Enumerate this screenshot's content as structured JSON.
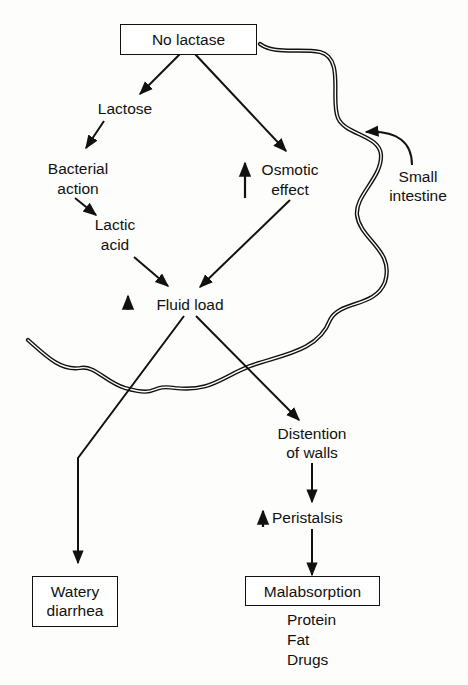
{
  "diagram": {
    "type": "flowchart",
    "topic": "Lactose intolerance pathophysiology",
    "nodes": {
      "no_lactase": "No lactase",
      "lactose": "Lactose",
      "bacterial_action_1": "Bacterial",
      "bacterial_action_2": "action",
      "lactic_acid_1": "Lactic",
      "lactic_acid_2": "acid",
      "osmotic_effect_1": "Osmotic",
      "osmotic_effect_2": "effect",
      "fluid_load": "Fluid load",
      "small_intestine_1": "Small",
      "small_intestine_2": "intestine",
      "distention_1": "Distention",
      "distention_2": "of walls",
      "peristalsis": "Peristalsis",
      "watery_diarrhea_1": "Watery",
      "watery_diarrhea_2": "diarrhea",
      "malabsorption": "Malabsorption",
      "malabsorbed": [
        "Protein",
        "Fat",
        "Drugs"
      ]
    },
    "increase_markers": [
      "Osmotic effect",
      "Fluid load",
      "Peristalsis"
    ],
    "edges": [
      [
        "No lactase",
        "Lactose"
      ],
      [
        "No lactase",
        "Osmotic effect"
      ],
      [
        "Lactose",
        "Bacterial action"
      ],
      [
        "Bacterial action",
        "Lactic acid"
      ],
      [
        "Lactic acid",
        "Fluid load"
      ],
      [
        "Osmotic effect",
        "Fluid load"
      ],
      [
        "Fluid load",
        "Watery diarrhea"
      ],
      [
        "Fluid load",
        "Distention of walls"
      ],
      [
        "Distention of walls",
        "Peristalsis"
      ],
      [
        "Peristalsis",
        "Malabsorption"
      ]
    ]
  }
}
